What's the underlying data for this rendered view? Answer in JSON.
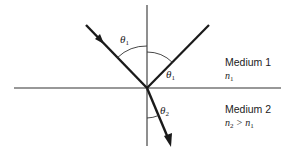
{
  "diagram": {
    "title": "",
    "media": [
      {
        "name": "Medium 1",
        "index_label": "n",
        "index_sub": "1",
        "relation": ""
      },
      {
        "name": "Medium 2",
        "index_label": "n",
        "index_sub": "2",
        "relation": " > n",
        "relation_sub": "1"
      }
    ],
    "angles": [
      {
        "symbol": "θ",
        "sub": "1",
        "meaning": "angle of incidence"
      },
      {
        "symbol": "θ",
        "sub": "1",
        "meaning": "angle of reflection"
      },
      {
        "symbol": "θ",
        "sub": "2",
        "meaning": "angle of refraction"
      }
    ],
    "elements": {
      "normal": "normal line",
      "interface": "boundary between media",
      "incident_ray": "incident ray",
      "reflected_ray": "reflected ray",
      "refracted_ray": "refracted ray"
    },
    "colors": {
      "line": "#1a1a1a",
      "thin_line": "#333333",
      "background": "#ffffff"
    }
  }
}
